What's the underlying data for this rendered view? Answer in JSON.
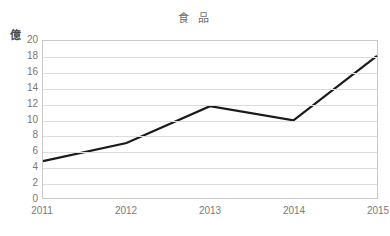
{
  "chart_data": {
    "type": "line",
    "title": "食 品",
    "xlabel": "",
    "ylabel": "億",
    "y_unit": "億",
    "categories": [
      "2011",
      "2012",
      "2013",
      "2014",
      "2015"
    ],
    "x": [
      2011,
      2012,
      2013,
      2014,
      2015
    ],
    "values": [
      4.7,
      7.0,
      11.7,
      9.9,
      18.1
    ],
    "series": [
      {
        "name": "食 品",
        "values": [
          4.7,
          7.0,
          11.7,
          9.9,
          18.1
        ]
      }
    ],
    "ylim": [
      0,
      20
    ],
    "ytick_step": 2,
    "yticks": [
      20,
      18,
      16,
      14,
      12,
      10,
      8,
      6,
      4,
      2,
      0
    ],
    "ytick_labels": [
      "20",
      "18",
      "16",
      "14",
      "12",
      "10",
      "8",
      "6",
      "4",
      "2",
      "0"
    ],
    "xtick_labels": [
      "2011",
      "2012",
      "2013",
      "2014",
      "2015"
    ],
    "grid": true,
    "grid_axis": "y",
    "legend": false,
    "legend_position": "none",
    "markers": false,
    "colors": {
      "line": "#1a1a1a",
      "grid": "#dcdcdc",
      "axis": "#c9c9c9",
      "text": "#787878",
      "title": "#6f6f6f",
      "background": "#ffffff"
    },
    "line_width": 2.2
  }
}
